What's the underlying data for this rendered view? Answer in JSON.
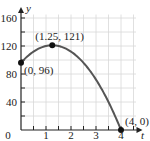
{
  "chart_data": {
    "type": "line",
    "title": "",
    "xlabel": "t",
    "ylabel": "y",
    "xlim": [
      0,
      4.6
    ],
    "ylim": [
      0,
      165
    ],
    "grid": true,
    "x_ticks": [
      "0",
      "1",
      "2",
      "3",
      "4"
    ],
    "y_ticks": [
      "40",
      "80",
      "120",
      "160"
    ],
    "series": [
      {
        "name": "y = -16t^2 + 40t + 96",
        "x": [
          0,
          0.5,
          1,
          1.25,
          1.5,
          2,
          2.5,
          3,
          3.5,
          4
        ],
        "values": [
          96,
          112,
          120,
          121,
          120,
          112,
          96,
          72,
          40,
          0
        ]
      }
    ],
    "annotations": [
      {
        "label": "(0, 96)",
        "x": 0,
        "y": 96
      },
      {
        "label": "(1.25, 121)",
        "x": 1.25,
        "y": 121
      },
      {
        "label": "(4, 0)",
        "x": 4,
        "y": 0
      }
    ],
    "colors": {
      "curve": "#555555",
      "grid": "#d8d8d8",
      "axis": "#222222"
    }
  }
}
